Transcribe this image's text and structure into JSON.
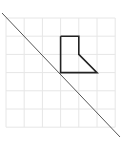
{
  "diagram": {
    "type": "reflection-grid",
    "grid": {
      "columns": 6,
      "rows": 6,
      "origin_px": [
        6,
        18
      ],
      "cell_px": 18.2,
      "line_color": "#e6e6e6"
    },
    "mirror_line": {
      "from_px": [
        2,
        13
      ],
      "to_px": [
        120,
        137
      ],
      "color": "#555555"
    },
    "shape": {
      "name": "boot-shape",
      "color": "#222222",
      "vertices_grid": [
        [
          3,
          1
        ],
        [
          4,
          1
        ],
        [
          4,
          2
        ],
        [
          5,
          3
        ],
        [
          3,
          3
        ],
        [
          3,
          1
        ]
      ]
    }
  }
}
